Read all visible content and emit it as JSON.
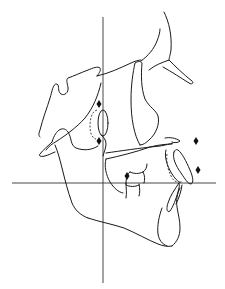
{
  "figure": {
    "type": "cephalometric tracing",
    "background": "#ffffff",
    "line_color": "#1a1a1a",
    "axes": {
      "vertical": {
        "x": 103,
        "y1": 17,
        "y2": 283
      },
      "horizontal": {
        "y": 183,
        "x1": 12,
        "x2": 216
      }
    },
    "landmark_markers": [
      {
        "name": "condyle-upper",
        "x": 99,
        "y": 104
      },
      {
        "name": "condyle-lower",
        "x": 99,
        "y": 141
      },
      {
        "name": "molar-contact",
        "x": 127,
        "y": 176
      },
      {
        "name": "upper-incisor-anterior",
        "x": 196,
        "y": 141
      },
      {
        "name": "lower-lip-anterior",
        "x": 198,
        "y": 170
      }
    ],
    "structures": [
      "cranial-base",
      "sella-turcica",
      "pterygomaxillary-fissure",
      "nasal-bone",
      "maxilla",
      "upper-incisor",
      "lower-incisor",
      "first-molars",
      "mandible",
      "ramus",
      "condyle",
      "symphysis"
    ]
  }
}
